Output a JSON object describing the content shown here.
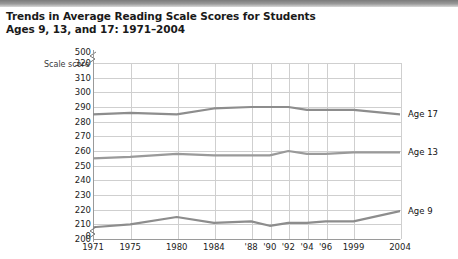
{
  "header": {
    "band_color": "#8a8a8a"
  },
  "title": {
    "line1": "Trends in Average Reading Scale Scores for Students",
    "line2": "Ages 9, 13, and 17: 1971–2004"
  },
  "axis": {
    "y_axis_label": "Scale score",
    "y_top_label": "500",
    "y_zero_label": "0",
    "break_symbol": "≈"
  },
  "chart_data": {
    "type": "line",
    "title": "Trends in Average Reading Scale Scores for Students Ages 9, 13, and 17: 1971–2004",
    "xlabel": "",
    "ylabel": "Scale score",
    "grid": true,
    "legend_position": "right-inline",
    "axis_break": true,
    "ylim": [
      200,
      320
    ],
    "yticks": [
      320,
      310,
      300,
      290,
      280,
      270,
      260,
      250,
      240,
      230,
      220,
      210,
      200
    ],
    "y_extra_ticks": [
      "500",
      "0"
    ],
    "x": [
      1971,
      1975,
      1980,
      1984,
      1988,
      1990,
      1992,
      1994,
      1996,
      1999,
      2004
    ],
    "xtick_labels": [
      "1971",
      "1975",
      "1980",
      "1984",
      "'88",
      "'90",
      "'92",
      "'94",
      "'96",
      "1999",
      "2004"
    ],
    "series": [
      {
        "name": "Age 17",
        "color": "#8d8d8d",
        "values": [
          285,
          286,
          285,
          289,
          290,
          290,
          290,
          288,
          288,
          288,
          285
        ]
      },
      {
        "name": "Age 13",
        "color": "#9a9a9a",
        "values": [
          255,
          256,
          258,
          257,
          257,
          257,
          260,
          258,
          258,
          259,
          259
        ]
      },
      {
        "name": "Age 9",
        "color": "#8d8d8d",
        "values": [
          208,
          210,
          215,
          211,
          212,
          209,
          211,
          211,
          212,
          212,
          219
        ]
      }
    ]
  }
}
